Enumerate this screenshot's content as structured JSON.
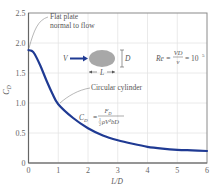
{
  "chart_data": {
    "type": "line",
    "title": "",
    "xlabel": "L/D",
    "ylabel": "C_D",
    "xlim": [
      0,
      6
    ],
    "ylim": [
      0,
      2.5
    ],
    "x_ticks": [
      "0",
      "1",
      "2",
      "3",
      "4",
      "5",
      "6"
    ],
    "y_ticks": [
      "0",
      "0.5",
      "1.0",
      "1.5",
      "2.0",
      "2.5"
    ],
    "grid": true,
    "series": [
      {
        "name": "Drag coefficient vs. length-to-diameter ratio",
        "color": "#1f3a93",
        "x": [
          0,
          0.1,
          0.2,
          0.4,
          0.6,
          0.8,
          1.0,
          1.5,
          2.0,
          2.5,
          3.0,
          3.5,
          4.0,
          4.5,
          5.0,
          5.5,
          6.0
        ],
        "y": [
          1.88,
          1.87,
          1.82,
          1.62,
          1.38,
          1.16,
          0.98,
          0.75,
          0.58,
          0.46,
          0.38,
          0.32,
          0.27,
          0.24,
          0.22,
          0.21,
          0.2
        ]
      }
    ],
    "annotations": [
      {
        "text_line1": "Flat plate",
        "text_line2": "normal to flow",
        "points_to": [
          0,
          1.88
        ]
      },
      {
        "text": "Circular cylinder",
        "points_to": [
          1.0,
          0.98
        ]
      },
      {
        "text": "Re = VD/ν = 10^5"
      },
      {
        "text": "C_D = F_D / (½ρV²bD)"
      }
    ],
    "inset": {
      "velocity_label": "V",
      "length_label": "L",
      "diameter_label": "D",
      "body_color": "#a8a8a8",
      "arrow_color": "#1f3a93"
    }
  },
  "labels": {
    "x_axis": "L/D",
    "y_axis_main": "C",
    "y_axis_sub": "D",
    "flat_plate_1": "Flat plate",
    "flat_plate_2": "normal to flow",
    "circular_cylinder": "Circular cylinder",
    "re_lhs": "Re =",
    "re_num": "VD",
    "re_den": "ν",
    "re_rhs": "= 10",
    "re_exp": "5",
    "cd_lhs": "C",
    "cd_lhs_sub": "D",
    "cd_eq": "=",
    "cd_num": "F",
    "cd_num_sub": "D",
    "cd_den": "ρV²bD",
    "cd_half_num": "1",
    "cd_half_den": "2",
    "v": "V",
    "l": "L",
    "d": "D"
  },
  "ticks": {
    "x": [
      "0",
      "1",
      "2",
      "3",
      "4",
      "5",
      "6"
    ],
    "y": [
      "0",
      "0.5",
      "1.0",
      "1.5",
      "2.0",
      "2.5"
    ]
  }
}
